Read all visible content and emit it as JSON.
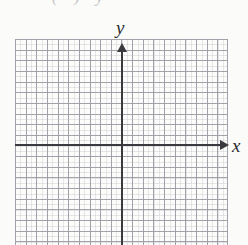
{
  "figure": {
    "kind": "blank-coordinate-plane",
    "top_partial_text": "(    ) y",
    "background_color": "#fbfbfa",
    "axis_color": "#3a3a3e",
    "grid_major_color": "#9e9ea6",
    "grid_minor_color": "#c4c4ca"
  },
  "axes": {
    "x_label": "x",
    "y_label": "y"
  },
  "chart_data": {
    "type": "scatter",
    "title": "",
    "subtitle": "",
    "xlabel": "x",
    "ylabel": "y",
    "x": [],
    "y": [],
    "series": [],
    "annotations": [],
    "legend": [],
    "legend_position": "none",
    "grid": true,
    "grid_major_step": 1,
    "grid_minor_divisions": 2,
    "xlim": [
      -10,
      10
    ],
    "ylim": [
      -10,
      9
    ],
    "xticks": [
      -10,
      -9,
      -8,
      -7,
      -6,
      -5,
      -4,
      -3,
      -2,
      -1,
      0,
      1,
      2,
      3,
      4,
      5,
      6,
      7,
      8,
      9,
      10
    ],
    "yticks": [
      -10,
      -9,
      -8,
      -7,
      -6,
      -5,
      -4,
      -3,
      -2,
      -1,
      0,
      1,
      2,
      3,
      4,
      5,
      6,
      7,
      8,
      9
    ],
    "xtick_labels": [],
    "ytick_labels": [],
    "x_axis_arrow": "right",
    "y_axis_arrow": "up",
    "note": "Empty graph paper grid with unlabeled x and y axes; no data plotted."
  }
}
